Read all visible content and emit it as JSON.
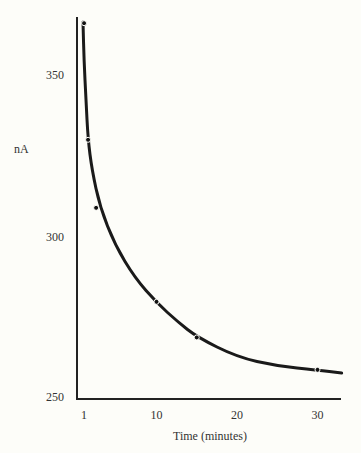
{
  "chart_data": {
    "type": "line",
    "title": "",
    "xlabel": "Time (minutes)",
    "ylabel": "nA",
    "x_ticks": [
      1,
      10,
      20,
      30
    ],
    "y_ticks": [
      250,
      300,
      350
    ],
    "xlim": [
      0,
      33
    ],
    "ylim": [
      250,
      370
    ],
    "grid": false,
    "legend": null,
    "series": [
      {
        "name": "current",
        "x": [
          1,
          1.5,
          2.5,
          10,
          15,
          30
        ],
        "y": [
          366,
          330,
          309,
          280,
          269,
          259
        ],
        "markers": true
      }
    ],
    "curve_end": {
      "x": 33,
      "y": 258
    }
  }
}
